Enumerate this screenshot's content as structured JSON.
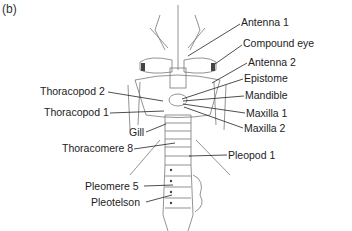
{
  "figure": {
    "panel_label": "(b)",
    "labels": {
      "antenna_1": "Antenna 1",
      "compound_eye": "Compound eye",
      "antenna_2": "Antenna 2",
      "epistome": "Epistome",
      "mandible": "Mandible",
      "maxilla_1": "Maxilla 1",
      "maxilla_2": "Maxilla 2",
      "thoracopod_2": "Thoracopod 2",
      "thoracopod_1": "Thoracopod 1",
      "gill": "Gill",
      "thoracomere_8": "Thoracomere 8",
      "pleopod_1": "Pleopod 1",
      "pleomere_5": "Pleomere 5",
      "pleotelson": "Pleotelson"
    }
  }
}
